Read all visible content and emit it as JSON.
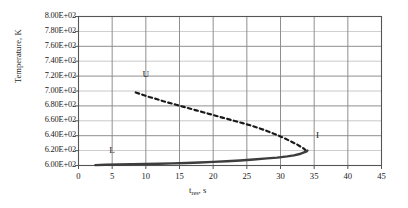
{
  "chart_data": {
    "type": "line",
    "title": "",
    "subtitle": "",
    "xlabel": "t_res, s",
    "xlabel_base": "t",
    "xlabel_sub": "res",
    "xlabel_tail": ", s",
    "ylabel": "Temperature, K",
    "xlim": [
      0,
      45
    ],
    "ylim": [
      600,
      800
    ],
    "xticks": [
      0,
      5,
      10,
      15,
      20,
      25,
      30,
      35,
      40,
      45
    ],
    "xtick_labels": [
      "0",
      "5",
      "10",
      "15",
      "20",
      "25",
      "30",
      "35",
      "40",
      "45"
    ],
    "yticks": [
      600,
      620,
      640,
      660,
      680,
      700,
      720,
      740,
      760,
      780,
      800
    ],
    "ytick_labels": [
      "6.00E+02",
      "6.20E+02",
      "6.40E+02",
      "6.60E+02",
      "6.80E+02",
      "7.00E+02",
      "7.20E+02",
      "7.40E+02",
      "7.60E+02",
      "7.80E+02",
      "8.00E+02"
    ],
    "grid": true,
    "grid_x": true,
    "grid_y": true,
    "legend_position": "inline-annotations",
    "annotations": [
      {
        "text": "U",
        "x": 10.0,
        "y": 722.0,
        "series": "upper"
      },
      {
        "text": "L",
        "x": 5.0,
        "y": 620.0,
        "series": "lower"
      },
      {
        "text": "I",
        "x": 35.5,
        "y": 640.0,
        "series": "interface"
      }
    ],
    "series": [
      {
        "name": "U",
        "style": "dashed",
        "color": "#1a1a1a",
        "width": 2.2,
        "x": [
          8.5,
          9.5,
          10.5,
          11.5,
          12.5,
          13.5,
          14.5,
          15.5,
          16.5,
          17.5,
          18.5,
          19.5,
          20.5,
          21.5,
          22.5,
          23.5,
          24.5,
          25.5,
          26.5,
          27.5,
          28.5,
          29.5,
          30.5,
          31.5,
          32.5,
          33.5,
          34.0
        ],
        "y": [
          698.0,
          695.0,
          692.0,
          689.5,
          686.5,
          684.0,
          681.5,
          679.0,
          676.5,
          674.0,
          671.5,
          669.0,
          666.5,
          664.0,
          661.5,
          659.0,
          656.5,
          654.0,
          651.0,
          648.0,
          644.5,
          641.0,
          637.0,
          632.5,
          628.0,
          622.5,
          618.0
        ]
      },
      {
        "name": "L",
        "style": "solid",
        "color": "#3d3d3d",
        "width": 2.4,
        "x": [
          2.5,
          4.0,
          6.0,
          8.0,
          10.0,
          12.0,
          14.0,
          16.0,
          18.0,
          20.0,
          22.0,
          24.0,
          26.0,
          28.0,
          29.5,
          31.0,
          32.0,
          33.0,
          33.8,
          34.0
        ],
        "y": [
          600.5,
          601.0,
          601.3,
          601.6,
          602.0,
          602.4,
          602.9,
          603.4,
          604.0,
          604.8,
          605.7,
          606.8,
          608.0,
          609.5,
          610.6,
          612.2,
          613.6,
          615.8,
          618.5,
          620.0
        ]
      }
    ]
  },
  "plot": {
    "frame_color": "#555555",
    "grid_color": "#8a8a8a",
    "background": "#ffffff"
  }
}
